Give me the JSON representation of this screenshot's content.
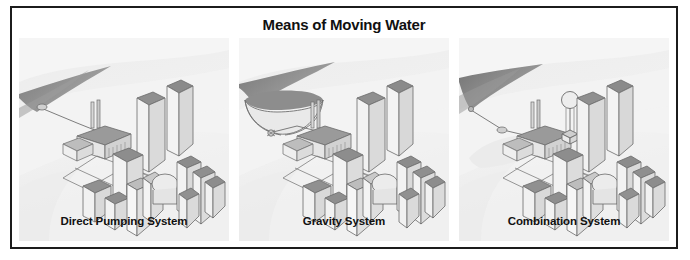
{
  "figure": {
    "title": "Means of Moving Water",
    "border_color": "#1c1c1c",
    "background_color": "#ffffff"
  },
  "palette": {
    "panel_background": "#eeeeee",
    "panel_highlight": "#f6f6f6",
    "water_dark": "#8a8a8a",
    "water_mid": "#a8a8a8",
    "land_light": "#f2f2f2",
    "building_face_light": "#f4f4f4",
    "building_face_mid": "#dcdcdc",
    "building_top_dark": "#8f8f8f",
    "outline": "#6b6b6b",
    "text": "#111111"
  },
  "panels": [
    {
      "caption": "Direct Pumping System",
      "scene": {
        "water_feature": "river",
        "has_intake_pipe": true,
        "has_pumping_station": true,
        "smokestacks": 2,
        "has_reservoir": false,
        "has_water_tower": false,
        "has_city_skyline": true,
        "has_distribution_grid": true
      }
    },
    {
      "caption": "Gravity System",
      "scene": {
        "water_feature": "reservoir",
        "has_intake_pipe": true,
        "has_pumping_station": true,
        "smokestacks": 2,
        "has_reservoir": true,
        "has_water_tower": false,
        "has_city_skyline": true,
        "has_distribution_grid": true
      }
    },
    {
      "caption": "Combination System",
      "scene": {
        "water_feature": "river",
        "has_intake_pipe": true,
        "has_pumping_station": true,
        "smokestacks": 2,
        "has_reservoir": false,
        "has_water_tower": true,
        "has_city_skyline": true,
        "has_distribution_grid": true
      }
    }
  ]
}
